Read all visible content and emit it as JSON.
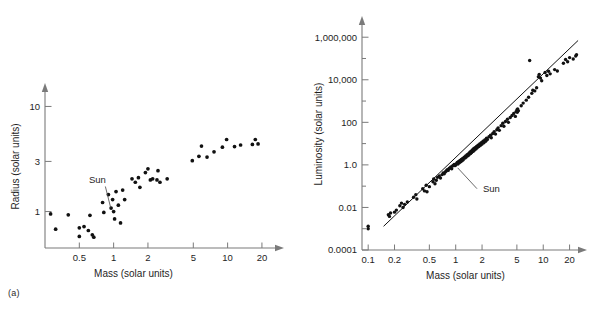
{
  "figure": {
    "background": "#ffffff",
    "point_color": "#111111",
    "axis_color": "#7a7a7a",
    "text_color": "#1e1e1e"
  },
  "panels": [
    {
      "id": "a",
      "tag": "(a)"
    },
    {
      "id": "b",
      "tag": "(b)"
    }
  ],
  "chart_data": [
    {
      "type": "scatter",
      "panel": "(a)",
      "title": "",
      "xlabel": "Mass (solar units)",
      "ylabel": "Radius (solar units)",
      "xscale": "log",
      "yscale": "log",
      "xlim": [
        0.25,
        30
      ],
      "ylim": [
        0.45,
        16
      ],
      "xticks": [
        0.5,
        1,
        2,
        5,
        10,
        20
      ],
      "xticklabels": [
        "0.5",
        "1",
        "2",
        "5",
        "10",
        "20"
      ],
      "yticks": [
        1,
        3,
        10
      ],
      "yticklabels": [
        "1",
        "3",
        "10"
      ],
      "grid": false,
      "legend": "none",
      "annotations": [
        {
          "text": "Sun",
          "x": 1.0,
          "y": 1.0,
          "label_x": 0.72,
          "label_y": 1.85
        }
      ],
      "points": [
        {
          "x": 0.28,
          "y": 0.95
        },
        {
          "x": 0.31,
          "y": 0.68
        },
        {
          "x": 0.4,
          "y": 0.93
        },
        {
          "x": 0.5,
          "y": 0.7
        },
        {
          "x": 0.5,
          "y": 0.58
        },
        {
          "x": 0.55,
          "y": 0.72
        },
        {
          "x": 0.6,
          "y": 0.66
        },
        {
          "x": 0.62,
          "y": 0.92
        },
        {
          "x": 0.65,
          "y": 0.6
        },
        {
          "x": 0.67,
          "y": 0.57
        },
        {
          "x": 0.8,
          "y": 1.22
        },
        {
          "x": 0.82,
          "y": 0.98
        },
        {
          "x": 0.9,
          "y": 1.45
        },
        {
          "x": 0.95,
          "y": 1.08
        },
        {
          "x": 0.98,
          "y": 1.3
        },
        {
          "x": 1.0,
          "y": 1.0
        },
        {
          "x": 1.02,
          "y": 0.85
        },
        {
          "x": 1.05,
          "y": 1.55
        },
        {
          "x": 1.1,
          "y": 1.15
        },
        {
          "x": 1.15,
          "y": 0.78
        },
        {
          "x": 1.2,
          "y": 1.6
        },
        {
          "x": 1.25,
          "y": 1.3
        },
        {
          "x": 1.45,
          "y": 2.05
        },
        {
          "x": 1.55,
          "y": 1.9
        },
        {
          "x": 1.65,
          "y": 2.1
        },
        {
          "x": 1.7,
          "y": 1.7
        },
        {
          "x": 1.9,
          "y": 2.35
        },
        {
          "x": 2.0,
          "y": 2.55
        },
        {
          "x": 2.1,
          "y": 2.0
        },
        {
          "x": 2.2,
          "y": 2.05
        },
        {
          "x": 2.4,
          "y": 2.0
        },
        {
          "x": 2.45,
          "y": 2.45
        },
        {
          "x": 2.55,
          "y": 1.9
        },
        {
          "x": 2.95,
          "y": 2.05
        },
        {
          "x": 4.9,
          "y": 3.05
        },
        {
          "x": 5.6,
          "y": 3.35
        },
        {
          "x": 5.9,
          "y": 4.2
        },
        {
          "x": 6.6,
          "y": 3.3
        },
        {
          "x": 7.6,
          "y": 3.7
        },
        {
          "x": 9.0,
          "y": 4.1
        },
        {
          "x": 9.8,
          "y": 4.85
        },
        {
          "x": 11.5,
          "y": 4.15
        },
        {
          "x": 13.0,
          "y": 4.3
        },
        {
          "x": 16.5,
          "y": 4.35
        },
        {
          "x": 17.5,
          "y": 4.85
        },
        {
          "x": 18.5,
          "y": 4.4
        }
      ]
    },
    {
      "type": "scatter",
      "panel": "(b)",
      "title": "",
      "xlabel": "Mass (solar units)",
      "ylabel": "Luminosity (solar units)",
      "xscale": "log",
      "yscale": "log",
      "xlim": [
        0.085,
        30
      ],
      "ylim": [
        0.0001,
        8000000
      ],
      "xticks": [
        0.1,
        0.2,
        0.5,
        1,
        2,
        5,
        10,
        20
      ],
      "xticklabels": [
        "0.1",
        "0.2",
        "0.5",
        "1",
        "2",
        "5",
        "10",
        "20"
      ],
      "yticks": [
        0.0001,
        0.01,
        1.0,
        100,
        10000,
        1000000
      ],
      "yticklabels": [
        "0.0001",
        "0.01",
        "1.0",
        "100",
        "10,000",
        "1,000,000"
      ],
      "minor_yticks": [
        0.001,
        0.1,
        10,
        1000,
        100000,
        10000000
      ],
      "grid": false,
      "legend": "none",
      "fit_line": {
        "x0": 0.15,
        "y0": 0.0013,
        "x1": 25,
        "y1": 700000,
        "slope_note": "mass-luminosity relation"
      },
      "annotations": [
        {
          "text": "Sun",
          "x": 1.0,
          "y": 1.0,
          "label_x": 2.05,
          "label_y": 0.055
        }
      ],
      "points": [
        {
          "x": 0.1,
          "y": 0.0013
        },
        {
          "x": 0.1,
          "y": 0.001
        },
        {
          "x": 0.17,
          "y": 0.0045
        },
        {
          "x": 0.18,
          "y": 0.0055
        },
        {
          "x": 0.175,
          "y": 0.0038
        },
        {
          "x": 0.2,
          "y": 0.006
        },
        {
          "x": 0.21,
          "y": 0.0075
        },
        {
          "x": 0.23,
          "y": 0.012
        },
        {
          "x": 0.24,
          "y": 0.016
        },
        {
          "x": 0.25,
          "y": 0.01
        },
        {
          "x": 0.26,
          "y": 0.014
        },
        {
          "x": 0.28,
          "y": 0.018
        },
        {
          "x": 0.33,
          "y": 0.03
        },
        {
          "x": 0.35,
          "y": 0.04
        },
        {
          "x": 0.36,
          "y": 0.025
        },
        {
          "x": 0.42,
          "y": 0.075
        },
        {
          "x": 0.44,
          "y": 0.06
        },
        {
          "x": 0.46,
          "y": 0.11
        },
        {
          "x": 0.47,
          "y": 0.055
        },
        {
          "x": 0.5,
          "y": 0.095
        },
        {
          "x": 0.55,
          "y": 0.16
        },
        {
          "x": 0.56,
          "y": 0.22
        },
        {
          "x": 0.58,
          "y": 0.13
        },
        {
          "x": 0.6,
          "y": 0.19
        },
        {
          "x": 0.62,
          "y": 0.26
        },
        {
          "x": 0.65,
          "y": 0.3
        },
        {
          "x": 0.67,
          "y": 0.24
        },
        {
          "x": 0.7,
          "y": 0.35
        },
        {
          "x": 0.72,
          "y": 0.42
        },
        {
          "x": 0.74,
          "y": 0.38
        },
        {
          "x": 0.76,
          "y": 0.46
        },
        {
          "x": 0.78,
          "y": 0.52
        },
        {
          "x": 0.8,
          "y": 0.6
        },
        {
          "x": 0.82,
          "y": 0.55
        },
        {
          "x": 0.84,
          "y": 0.68
        },
        {
          "x": 0.86,
          "y": 0.72
        },
        {
          "x": 0.88,
          "y": 0.8
        },
        {
          "x": 0.9,
          "y": 0.66
        },
        {
          "x": 0.92,
          "y": 0.88
        },
        {
          "x": 0.94,
          "y": 0.95
        },
        {
          "x": 0.96,
          "y": 1.05
        },
        {
          "x": 0.98,
          "y": 0.92
        },
        {
          "x": 1.0,
          "y": 1.0
        },
        {
          "x": 1.02,
          "y": 1.15
        },
        {
          "x": 1.04,
          "y": 1.3
        },
        {
          "x": 1.06,
          "y": 1.1
        },
        {
          "x": 1.08,
          "y": 1.45
        },
        {
          "x": 1.1,
          "y": 1.25
        },
        {
          "x": 1.12,
          "y": 1.6
        },
        {
          "x": 1.14,
          "y": 1.4
        },
        {
          "x": 1.16,
          "y": 1.8
        },
        {
          "x": 1.18,
          "y": 1.55
        },
        {
          "x": 1.2,
          "y": 2.0
        },
        {
          "x": 1.22,
          "y": 1.75
        },
        {
          "x": 1.25,
          "y": 2.3
        },
        {
          "x": 1.28,
          "y": 2.1
        },
        {
          "x": 1.3,
          "y": 2.6
        },
        {
          "x": 1.32,
          "y": 2.35
        },
        {
          "x": 1.35,
          "y": 3.0
        },
        {
          "x": 1.38,
          "y": 2.7
        },
        {
          "x": 1.4,
          "y": 3.4
        },
        {
          "x": 1.42,
          "y": 3.0
        },
        {
          "x": 1.45,
          "y": 3.9
        },
        {
          "x": 1.48,
          "y": 3.4
        },
        {
          "x": 1.5,
          "y": 4.4
        },
        {
          "x": 1.52,
          "y": 3.8
        },
        {
          "x": 1.55,
          "y": 5.0
        },
        {
          "x": 1.58,
          "y": 4.3
        },
        {
          "x": 1.6,
          "y": 5.7
        },
        {
          "x": 1.63,
          "y": 4.9
        },
        {
          "x": 1.66,
          "y": 6.5
        },
        {
          "x": 1.7,
          "y": 5.6
        },
        {
          "x": 1.73,
          "y": 7.4
        },
        {
          "x": 1.76,
          "y": 6.4
        },
        {
          "x": 1.8,
          "y": 8.4
        },
        {
          "x": 1.84,
          "y": 7.3
        },
        {
          "x": 1.88,
          "y": 9.6
        },
        {
          "x": 1.92,
          "y": 8.3
        },
        {
          "x": 1.96,
          "y": 11.0
        },
        {
          "x": 2.0,
          "y": 9.5
        },
        {
          "x": 2.05,
          "y": 13.0
        },
        {
          "x": 2.1,
          "y": 11.0
        },
        {
          "x": 2.15,
          "y": 15.0
        },
        {
          "x": 2.2,
          "y": 13.0
        },
        {
          "x": 2.25,
          "y": 18.0
        },
        {
          "x": 2.3,
          "y": 15.5
        },
        {
          "x": 2.4,
          "y": 21.0
        },
        {
          "x": 2.5,
          "y": 25.0
        },
        {
          "x": 2.55,
          "y": 19.0
        },
        {
          "x": 2.65,
          "y": 30.0
        },
        {
          "x": 2.75,
          "y": 36.0
        },
        {
          "x": 2.85,
          "y": 28.0
        },
        {
          "x": 2.95,
          "y": 45.0
        },
        {
          "x": 3.05,
          "y": 55.0
        },
        {
          "x": 3.15,
          "y": 42.0
        },
        {
          "x": 3.3,
          "y": 70.0
        },
        {
          "x": 3.45,
          "y": 90.0
        },
        {
          "x": 3.55,
          "y": 65.0
        },
        {
          "x": 3.7,
          "y": 110.0
        },
        {
          "x": 3.9,
          "y": 140.0
        },
        {
          "x": 4.0,
          "y": 100.0
        },
        {
          "x": 4.2,
          "y": 170.0
        },
        {
          "x": 4.4,
          "y": 210.0
        },
        {
          "x": 4.6,
          "y": 260.0
        },
        {
          "x": 4.8,
          "y": 190.0
        },
        {
          "x": 4.9,
          "y": 320.0
        },
        {
          "x": 5.0,
          "y": 380.0
        },
        {
          "x": 5.05,
          "y": 300.0
        },
        {
          "x": 5.1,
          "y": 430.0
        },
        {
          "x": 5.2,
          "y": 350.0
        },
        {
          "x": 5.6,
          "y": 600.0
        },
        {
          "x": 5.9,
          "y": 800.0
        },
        {
          "x": 6.4,
          "y": 1100.0
        },
        {
          "x": 6.8,
          "y": 1500.0
        },
        {
          "x": 7.0,
          "y": 80000.0
        },
        {
          "x": 7.4,
          "y": 2300.0
        },
        {
          "x": 7.6,
          "y": 3200.0
        },
        {
          "x": 8.0,
          "y": 3000.0
        },
        {
          "x": 8.4,
          "y": 4200.0
        },
        {
          "x": 8.8,
          "y": 14000.0
        },
        {
          "x": 9.0,
          "y": 18000.0
        },
        {
          "x": 9.3,
          "y": 12000.0
        },
        {
          "x": 9.6,
          "y": 9000.0
        },
        {
          "x": 10.5,
          "y": 22000.0
        },
        {
          "x": 11.0,
          "y": 16000.0
        },
        {
          "x": 11.5,
          "y": 25000.0
        },
        {
          "x": 12.0,
          "y": 19000.0
        },
        {
          "x": 13.5,
          "y": 30000.0
        },
        {
          "x": 14.5,
          "y": 26000.0
        },
        {
          "x": 17.0,
          "y": 60000.0
        },
        {
          "x": 18.0,
          "y": 90000.0
        },
        {
          "x": 19.0,
          "y": 70000.0
        },
        {
          "x": 20.0,
          "y": 110000.0
        },
        {
          "x": 22.0,
          "y": 95000.0
        },
        {
          "x": 23.5,
          "y": 130000.0
        },
        {
          "x": 24.0,
          "y": 150000.0
        }
      ]
    }
  ]
}
